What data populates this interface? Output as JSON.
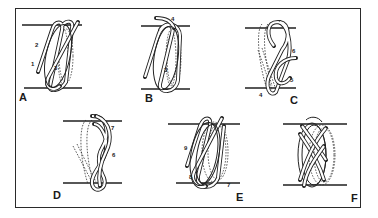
{
  "figure": {
    "panels": [
      {
        "letter": "A",
        "step_numbers": [
          "2",
          "1",
          "3"
        ]
      },
      {
        "letter": "B",
        "step_numbers": [
          "4",
          "3"
        ]
      },
      {
        "letter": "C",
        "step_numbers": [
          "6",
          "5",
          "4"
        ]
      },
      {
        "letter": "D",
        "step_numbers": [
          "7",
          "6"
        ]
      },
      {
        "letter": "E",
        "step_numbers": [
          "9",
          "8",
          "7"
        ]
      },
      {
        "letter": "F",
        "step_numbers": []
      }
    ]
  },
  "colors": {
    "ink": "#222222",
    "paper": "#ffffff"
  }
}
